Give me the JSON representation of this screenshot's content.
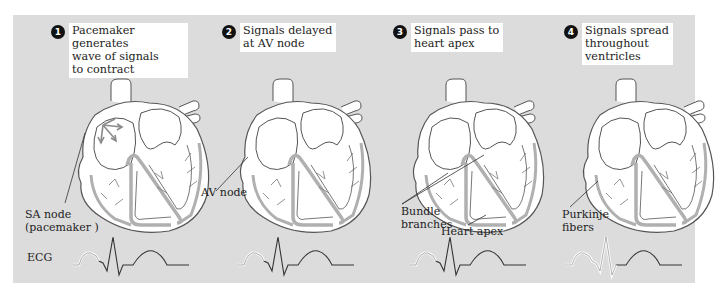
{
  "figure": {
    "ecg_label": "ECG",
    "colors": {
      "panel_background": "#dcdcdc",
      "heart_fill": "#ffffff",
      "outline": "#555555",
      "conduction_pathway": "#b0b0b0",
      "signal_arrows": "#8a8a8a",
      "badge": "#111111",
      "ecg_trace": "#333333",
      "ecg_highlight": "#ffffff"
    }
  },
  "steps": [
    {
      "number": "1",
      "caption": "Pacemaker generates\nwave of signals\nto contract",
      "labels": [
        {
          "text": "SA node\n(pacemaker )"
        }
      ],
      "ecg_highlight": "P wave"
    },
    {
      "number": "2",
      "caption": "Signals delayed\nat AV node",
      "labels": [
        {
          "text": "AV node"
        }
      ],
      "ecg_highlight": "P wave"
    },
    {
      "number": "3",
      "caption": "Signals pass to\nheart apex",
      "labels": [
        {
          "text": "Bundle\nbranches"
        },
        {
          "text": "Heart apex"
        }
      ],
      "ecg_highlight": "P wave"
    },
    {
      "number": "4",
      "caption": "Signals spread\nthroughout\nventricles",
      "labels": [
        {
          "text": "Purkinje\nfibers"
        }
      ],
      "ecg_highlight": "P wave + QRS complex"
    }
  ]
}
